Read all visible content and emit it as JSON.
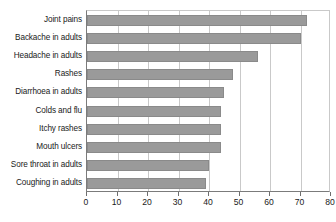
{
  "chart_data": {
    "type": "bar",
    "orientation": "horizontal",
    "title": "",
    "subtitle": "",
    "xlabel": "",
    "ylabel": "",
    "xlim": [
      0,
      80
    ],
    "xticks": [
      0,
      10,
      20,
      30,
      40,
      50,
      60,
      70,
      80
    ],
    "xtick_labels": [
      "0",
      "10",
      "20",
      "30",
      "40",
      "50",
      "60",
      "70",
      "80"
    ],
    "grid": "vertical",
    "legend": "none",
    "bar_color": "#9a9a9a",
    "bar_border_color": "#8a8a8a",
    "axis_color": "#7b7b7b",
    "gridline_color": "#c9c9c9",
    "text_color": "#1a1a1a",
    "categories": [
      "Joint pains",
      "Backache in adults",
      "Headache in adults",
      "Rashes",
      "Diarrhoea in adults",
      "Colds and flu",
      "Itchy rashes",
      "Mouth ulcers",
      "Sore throat in adults",
      "Coughing in adults"
    ],
    "values": [
      72,
      70,
      56,
      48,
      45,
      44,
      44,
      44,
      40,
      39
    ]
  }
}
